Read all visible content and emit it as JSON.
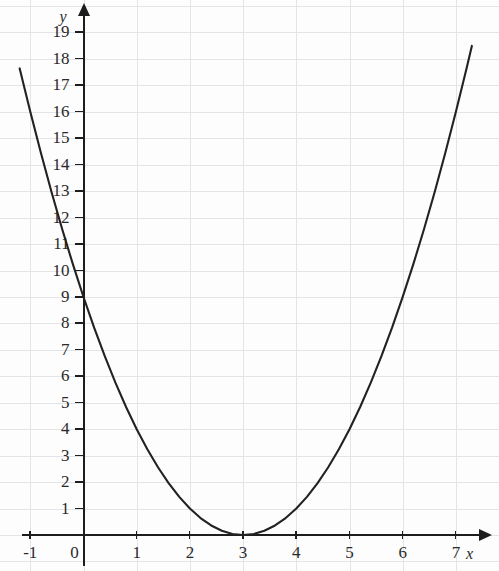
{
  "chart_data": {
    "type": "line",
    "title": "",
    "subtitle": "",
    "xlabel": "x",
    "ylabel": "y",
    "function": "y = (x - 3)^2",
    "xlim": [
      -1.35,
      7.45
    ],
    "ylim": [
      -0.7,
      19.9
    ],
    "xticks": [
      -1,
      0,
      1,
      2,
      3,
      4,
      5,
      6,
      7
    ],
    "yticks": [
      1,
      2,
      3,
      4,
      5,
      6,
      7,
      8,
      9,
      10,
      11,
      12,
      13,
      14,
      15,
      16,
      17,
      18,
      19
    ],
    "xtick_labels": [
      "-1",
      "0",
      "1",
      "2",
      "3",
      "4",
      "5",
      "6",
      "7"
    ],
    "ytick_labels": [
      "1",
      "2",
      "3",
      "4",
      "5",
      "6",
      "7",
      "8",
      "9",
      "10",
      "11",
      "12",
      "13",
      "14",
      "15",
      "16",
      "17",
      "18",
      "19"
    ],
    "grid": true,
    "grid_color": "#e2e4e8",
    "axis_color": "#1d1d1d",
    "curve_color": "#222222",
    "legend": [],
    "annotations": [],
    "vertex": {
      "x": 3,
      "y": 0
    },
    "y_intercept": {
      "x": 0,
      "y": 9
    },
    "x_domain_drawn": [
      -1.2,
      7.3
    ],
    "series": [
      {
        "name": "y = (x - 3)^2",
        "x": [
          -1.2,
          -1.0,
          -0.8,
          -0.6,
          -0.4,
          -0.2,
          0.0,
          0.2,
          0.4,
          0.6,
          0.8,
          1.0,
          1.2,
          1.4,
          1.6,
          1.8,
          2.0,
          2.2,
          2.4,
          2.6,
          2.8,
          3.0,
          3.2,
          3.4,
          3.6,
          3.8,
          4.0,
          4.2,
          4.4,
          4.6,
          4.8,
          5.0,
          5.2,
          5.4,
          5.6,
          5.8,
          6.0,
          6.2,
          6.4,
          6.6,
          6.8,
          7.0,
          7.2,
          7.3
        ],
        "values": [
          17.64,
          16.0,
          14.44,
          12.96,
          11.56,
          10.24,
          9.0,
          7.84,
          6.76,
          5.76,
          4.84,
          4.0,
          3.24,
          2.56,
          1.96,
          1.44,
          1.0,
          0.64,
          0.36,
          0.16,
          0.04,
          0.0,
          0.04,
          0.16,
          0.36,
          0.64,
          1.0,
          1.44,
          1.96,
          2.56,
          3.24,
          4.0,
          4.84,
          5.76,
          6.76,
          7.84,
          9.0,
          10.24,
          11.56,
          12.96,
          14.44,
          16.0,
          17.64,
          18.49
        ]
      }
    ]
  },
  "axes": {
    "y_axis_label": "y",
    "x_axis_label": "x"
  }
}
